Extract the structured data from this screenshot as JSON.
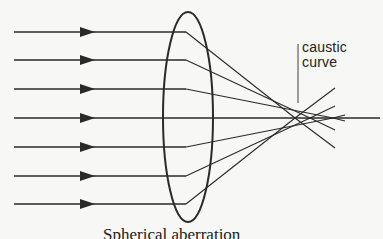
{
  "diagram": {
    "title": "Spherical aberration",
    "annotation": {
      "line1": "caustic",
      "line2": "curve"
    },
    "colors": {
      "background": "#f7f7f5",
      "ink": "#2a2a2a"
    },
    "lens": {
      "cx": 188,
      "cy": 117,
      "rx": 25,
      "ry": 105
    },
    "axis_y": 118,
    "incoming_rays": [
      {
        "y": 32,
        "exit_x": 185,
        "focus_x": 295
      },
      {
        "y": 60,
        "exit_x": 185,
        "focus_x": 310
      },
      {
        "y": 89,
        "exit_x": 185,
        "focus_x": 333
      },
      {
        "y": 118,
        "exit_x": 380,
        "focus_x": 380
      },
      {
        "y": 147,
        "exit_x": 185,
        "focus_x": 333
      },
      {
        "y": 176,
        "exit_x": 185,
        "focus_x": 310
      },
      {
        "y": 204,
        "exit_x": 185,
        "focus_x": 295
      }
    ]
  }
}
